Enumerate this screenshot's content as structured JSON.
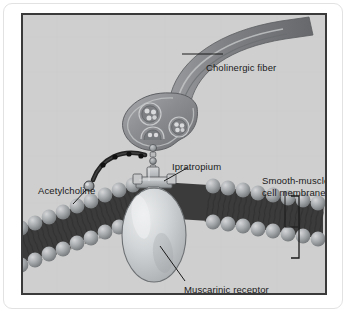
{
  "figure": {
    "type": "medical-illustration",
    "background_color": "#cfcfcf",
    "frame_color": "#3a3a3a",
    "page_background": "#ffffff"
  },
  "labels": {
    "cholinergic_fiber": "Cholinergic fiber",
    "ipratropium": "Ipratropium",
    "acetylcholine": "Acetylcholine",
    "smooth_muscle_line1": "Smooth-muscle",
    "smooth_muscle_line2": "cell membrane",
    "muscarinic_receptor": "Muscarinic receptor"
  },
  "structures": {
    "nerve_terminal": {
      "name": "cholinergic fiber nerve terminal",
      "fill": "#8f9194",
      "vesicle_count": 3
    },
    "vesicles": {
      "name": "synaptic vesicles containing acetylcholine",
      "granules_per_vesicle": 4
    },
    "acetylcholine_chain": {
      "name": "acetylcholine molecules",
      "bead_count": 9,
      "color": "#2b2b2b"
    },
    "ipratropium_molecule": {
      "name": "ipratropium molecule blocking receptor",
      "fill": "#b9bbbd"
    },
    "muscarinic_receptor": {
      "name": "muscarinic receptor embedded in membrane",
      "fill": "#cdd0d2"
    },
    "membrane": {
      "name": "smooth-muscle cell phospholipid bilayer",
      "head_color": "#9fa2a5",
      "tail_color": "#2e2e2e"
    },
    "bracket": {
      "name": "membrane extent bracket",
      "color": "#1a1a1a"
    }
  }
}
